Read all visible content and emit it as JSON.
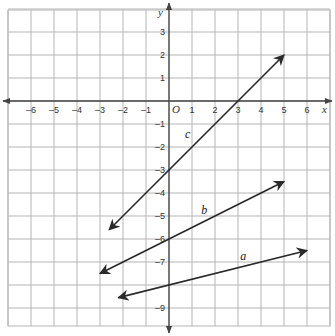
{
  "chart_data": {
    "type": "line",
    "title": "",
    "xlabel": "x",
    "ylabel": "y",
    "origin_label": "O",
    "xlim": [
      -7,
      7
    ],
    "ylim": [
      -10,
      4
    ],
    "grid": true,
    "x_ticks": [
      -6,
      -5,
      -4,
      -3,
      -2,
      -1,
      1,
      2,
      3,
      4,
      5,
      6
    ],
    "y_ticks": [
      3,
      2,
      1,
      -1,
      -2,
      -3,
      -4,
      -5,
      -6,
      -7,
      -9
    ],
    "x_tick_labels": [
      "–6",
      "–5",
      "–4",
      "–3",
      "–2",
      "–1",
      "1",
      "2",
      "3",
      "4",
      "5",
      "6"
    ],
    "y_tick_labels": [
      "3",
      "2",
      "1",
      "–1",
      "–2",
      "–3",
      "–4",
      "–5",
      "–6",
      "–7",
      "–9"
    ],
    "series": [
      {
        "name": "c",
        "equation": "y = x - 3",
        "x": [
          -2.6,
          5
        ],
        "y": [
          -5.6,
          2
        ],
        "label_pos": [
          0.7,
          -1.6
        ],
        "arrows": "both"
      },
      {
        "name": "b",
        "equation": "y = 0.5x - 6",
        "x": [
          -3,
          5
        ],
        "y": [
          -7.5,
          -3.5
        ],
        "label_pos": [
          1.4,
          -4.9
        ],
        "arrows": "both"
      },
      {
        "name": "a",
        "equation": "y = 0.25x - 8",
        "x": [
          -2.2,
          6
        ],
        "y": [
          -8.55,
          -6.5
        ],
        "label_pos": [
          3.1,
          -6.9
        ],
        "arrows": "both"
      }
    ],
    "colors": {
      "grid": "#b5b5b5",
      "axis": "#444444",
      "line": "#2a2a2a"
    }
  }
}
